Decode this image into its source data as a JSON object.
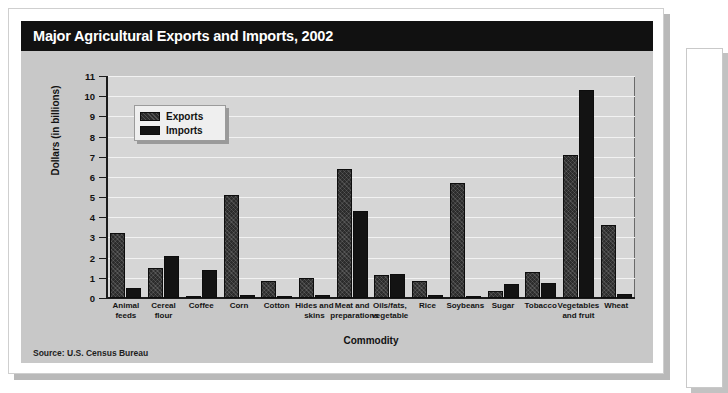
{
  "figure": {
    "title": "Major Agricultural Exports and Imports, 2002",
    "source": "Source: U.S. Census Bureau"
  },
  "legend": {
    "exports_label": "Exports",
    "imports_label": "Imports"
  },
  "colors": {
    "title_bar_bg": "#111111",
    "title_text": "#ffffff",
    "chart_body_bg": "#c8c8c8",
    "plot_bg": "#d6d6d6",
    "gridline": "#f2f2f2",
    "axis": "#1b1b1b",
    "exports_bar": "#2c2c2c",
    "imports_bar": "#131313",
    "legend_bg": "#efefef"
  },
  "chart_data": {
    "type": "bar",
    "title": "Major Agricultural Exports and Imports, 2002",
    "subtitle": "",
    "xlabel": "Commodity",
    "ylabel": "Dollars (in billions)",
    "ylim": [
      0,
      11
    ],
    "yticks": [
      0,
      1,
      2,
      3,
      4,
      5,
      6,
      7,
      8,
      9,
      10,
      11
    ],
    "ytick_labels": [
      "0",
      "1",
      "2",
      "3",
      "4",
      "5",
      "6",
      "7",
      "8",
      "9",
      "10",
      "11"
    ],
    "grid": true,
    "legend_position": "upper-left-inside",
    "categories": [
      "Animal feeds",
      "Cereal flour",
      "Coffee",
      "Corn",
      "Cotton",
      "Hides and skins",
      "Meat and preparations",
      "Oils/fats, vegetable",
      "Rice",
      "Soybeans",
      "Sugar",
      "Tobacco",
      "Vegetables and fruit",
      "Wheat"
    ],
    "category_lines": [
      [
        "Animal",
        "feeds"
      ],
      [
        "Cereal",
        "flour"
      ],
      [
        "Coffee"
      ],
      [
        "Corn"
      ],
      [
        "Cotton"
      ],
      [
        "Hides and",
        "skins"
      ],
      [
        "Meat and",
        "preparations"
      ],
      [
        "Oils/fats,",
        "vegetable"
      ],
      [
        "Rice"
      ],
      [
        "Soybeans"
      ],
      [
        "Sugar"
      ],
      [
        "Tobacco"
      ],
      [
        "Vegetables",
        "and fruit"
      ],
      [
        "Wheat"
      ]
    ],
    "series": [
      {
        "name": "Exports",
        "values": [
          3.2,
          1.5,
          0.05,
          5.1,
          0.85,
          1.0,
          6.4,
          1.15,
          0.85,
          5.7,
          0.35,
          1.3,
          7.1,
          3.6
        ]
      },
      {
        "name": "Imports",
        "values": [
          0.5,
          2.1,
          1.4,
          0.15,
          0.1,
          0.15,
          4.3,
          1.2,
          0.15,
          0.05,
          0.7,
          0.75,
          10.3,
          0.2
        ]
      }
    ],
    "units": "billions of US dollars"
  }
}
